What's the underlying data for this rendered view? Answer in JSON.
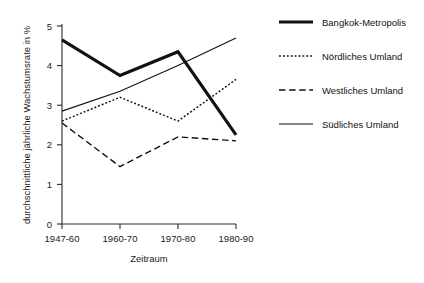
{
  "chart_data": {
    "type": "line",
    "title": "",
    "subtitle": "",
    "xlabel": "Zeitraum",
    "ylabel": "durchschnittliche jährliche Wachstumsrate in %",
    "categories": [
      "1947-60",
      "1960-70",
      "1970-80",
      "1980-90"
    ],
    "ylim": [
      0,
      5
    ],
    "yticks": [
      "0",
      "1",
      "2",
      "3",
      "4",
      "5"
    ],
    "grid": false,
    "legend_position": "right",
    "series": [
      {
        "name": "Bangkok-Metropolis",
        "style": "thick-solid",
        "values": [
          4.65,
          3.75,
          4.35,
          2.25
        ]
      },
      {
        "name": "Nördliches Umland",
        "style": "dotted",
        "values": [
          2.6,
          3.2,
          2.6,
          3.65
        ]
      },
      {
        "name": "Westliches Umland",
        "style": "dashed",
        "values": [
          2.55,
          1.45,
          2.2,
          2.1
        ]
      },
      {
        "name": "Südliches Umland",
        "style": "thin-solid",
        "values": [
          2.85,
          3.35,
          4.0,
          4.7
        ]
      }
    ]
  },
  "axis": {
    "y_title": "durchschnittliche jährliche Wachstumsrate in %",
    "x_title": "Zeitraum",
    "y_tick_0": "0",
    "y_tick_1": "1",
    "y_tick_2": "2",
    "y_tick_3": "3",
    "y_tick_4": "4",
    "y_tick_5": "5",
    "x_tick_0": "1947-60",
    "x_tick_1": "1960-70",
    "x_tick_2": "1970-80",
    "x_tick_3": "1980-90"
  },
  "legend": {
    "entries": [
      {
        "label": "Bangkok-Metropolis",
        "style": "thick-solid"
      },
      {
        "label": "Nördliches Umland",
        "style": "dotted"
      },
      {
        "label": "Westliches Umland",
        "style": "dashed"
      },
      {
        "label": "Südliches Umland",
        "style": "thin-solid"
      }
    ]
  },
  "colors": {
    "ink": "#111111",
    "axis": "#2b2b2b",
    "background": "#ffffff"
  }
}
